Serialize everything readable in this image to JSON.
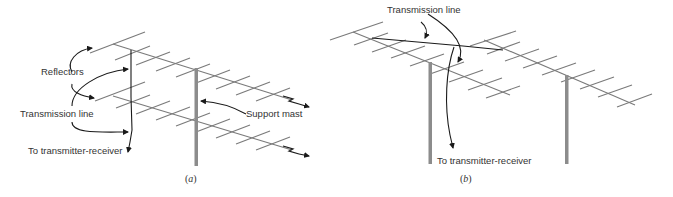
{
  "figure": {
    "panel_a": {
      "caption_letter": "a",
      "labels": {
        "reflectors": "Reflectors",
        "transmission_line": "Transmission line",
        "to_transmitter": "To transmitter-receiver",
        "support_mast": "Support mast"
      }
    },
    "panel_b": {
      "caption_letter": "b",
      "labels": {
        "transmission_line": "Transmission line",
        "to_transmitter": "To transmitter-receiver"
      }
    }
  },
  "colors": {
    "element": "#7a7a7a",
    "mast": "#8c8c8c",
    "wire": "#1a1a1a",
    "text": "#333333"
  }
}
